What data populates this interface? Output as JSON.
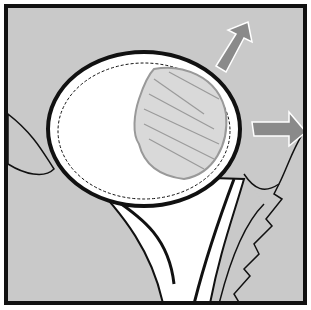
{
  "figure": {
    "colors": {
      "background": "#c9c9c9",
      "frame": "#111111",
      "organ_fill": "#ffffff",
      "mass_fill": "#a9a9a9",
      "arrow_fill": "#8a8a8a",
      "outline": "#111111"
    },
    "arrows": [
      {
        "name": "arrow-up-right",
        "direction": "up-right"
      },
      {
        "name": "arrow-right",
        "direction": "right"
      }
    ]
  }
}
